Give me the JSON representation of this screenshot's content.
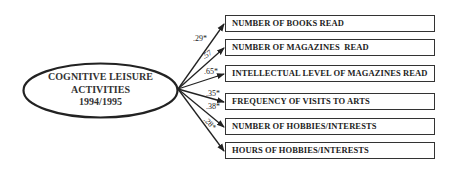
{
  "latent": {
    "line1": "COGNITIVE LEISURE",
    "line2": "ACTIVITIES",
    "line3": "1994/1995"
  },
  "indicators": [
    {
      "label": "NUMBER OF BOOKS READ",
      "loading": ".29*"
    },
    {
      "label": "NUMBER OF MAGAZINES  READ",
      "loading": ".57"
    },
    {
      "label": "INTELLECTUAL LEVEL OF MAGAZINES READ",
      "loading": ".65*"
    },
    {
      "label": "FREQUENCY OF VISITS TO ARTS",
      "loading": ".35*"
    },
    {
      "label": "NUMBER OF HOBBIES/INTERESTS",
      "loading": ".38*"
    },
    {
      "label": "HOURS OF HOBBIES/INTERESTS",
      "loading": ".28*"
    }
  ],
  "colors": {
    "stroke": "#222222",
    "background": "#ffffff"
  }
}
